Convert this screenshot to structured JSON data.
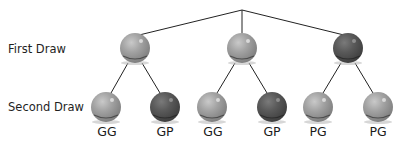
{
  "diagram": {
    "type": "probability-tree",
    "row_labels": {
      "first": "First Draw",
      "second": "Second Draw"
    },
    "colors": {
      "green_ball": "#9a9a9a",
      "purple_ball": "#555555",
      "line": "#222222"
    },
    "first_draw": [
      {
        "color": "G"
      },
      {
        "color": "G"
      },
      {
        "color": "P"
      }
    ],
    "outcomes": [
      {
        "label": "GG"
      },
      {
        "label": "GP"
      },
      {
        "label": "GG"
      },
      {
        "label": "GP"
      },
      {
        "label": "PG"
      },
      {
        "label": "PG"
      }
    ]
  }
}
